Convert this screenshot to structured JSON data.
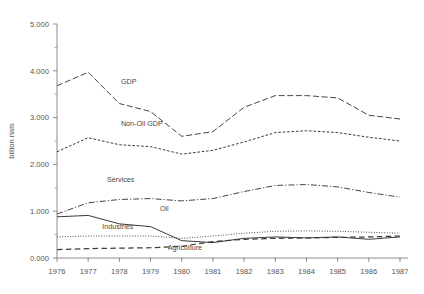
{
  "chart_data": {
    "type": "line",
    "title": "",
    "subtitle": "",
    "xlabel": "",
    "ylabel": "billion rials",
    "xlim": [
      1976,
      1987
    ],
    "ylim": [
      0,
      5
    ],
    "grid": false,
    "legend_position": "inline-annotations",
    "x": [
      1976,
      1977,
      1978,
      1979,
      1980,
      1981,
      1982,
      1983,
      1984,
      1985,
      1986,
      1987
    ],
    "x_tick_labels": [
      "1976",
      "1977",
      "1978",
      "1979",
      "1980",
      "1981",
      "1982",
      "1983",
      "1984",
      "1985",
      "1986",
      "1987"
    ],
    "y_tick_labels": [
      "0.000",
      "1.000",
      "2.000",
      "3.000",
      "4.000",
      "5.000"
    ],
    "y_ticks": [
      0,
      1,
      2,
      3,
      4,
      5
    ],
    "y_minor_ticks": [
      0.5,
      1.5,
      2.5,
      3.5,
      4.5
    ],
    "series": [
      {
        "name": "GDP",
        "style": "long-dash",
        "label_x": 1978.05,
        "label_y": 3.72,
        "values": [
          3.68,
          3.97,
          3.3,
          3.13,
          2.6,
          2.7,
          3.22,
          3.47,
          3.47,
          3.42,
          3.05,
          2.97
        ]
      },
      {
        "name": "Non-Oil GDP",
        "style": "short-dash",
        "label_x": 1978.05,
        "label_y": 2.82,
        "values": [
          2.27,
          2.57,
          2.42,
          2.38,
          2.22,
          2.3,
          2.48,
          2.68,
          2.72,
          2.68,
          2.58,
          2.5
        ]
      },
      {
        "name": "Services",
        "style": "dash-dot",
        "label_x": 1977.6,
        "label_y": 1.62,
        "values": [
          0.94,
          1.18,
          1.25,
          1.27,
          1.22,
          1.27,
          1.42,
          1.55,
          1.57,
          1.52,
          1.4,
          1.3
        ]
      },
      {
        "name": "Oil",
        "style": "solid",
        "label_x": 1979.3,
        "label_y": 1.0,
        "values": [
          0.88,
          0.91,
          0.73,
          0.67,
          0.37,
          0.33,
          0.42,
          0.45,
          0.43,
          0.45,
          0.4,
          0.45
        ]
      },
      {
        "name": "Industries",
        "style": "dotted",
        "label_x": 1977.45,
        "label_y": 0.62,
        "values": [
          0.45,
          0.47,
          0.47,
          0.47,
          0.42,
          0.47,
          0.53,
          0.57,
          0.58,
          0.57,
          0.55,
          0.53
        ]
      },
      {
        "name": "Agriculture",
        "style": "dash-wide",
        "label_x": 1979.55,
        "label_y": 0.17,
        "values": [
          0.18,
          0.2,
          0.21,
          0.22,
          0.25,
          0.35,
          0.4,
          0.42,
          0.43,
          0.44,
          0.45,
          0.47
        ]
      }
    ],
    "colors": {
      "line": "#3a3a3a",
      "axis": "#6e6e6e",
      "text": "#4a4a4a",
      "background": "#ffffff"
    }
  }
}
